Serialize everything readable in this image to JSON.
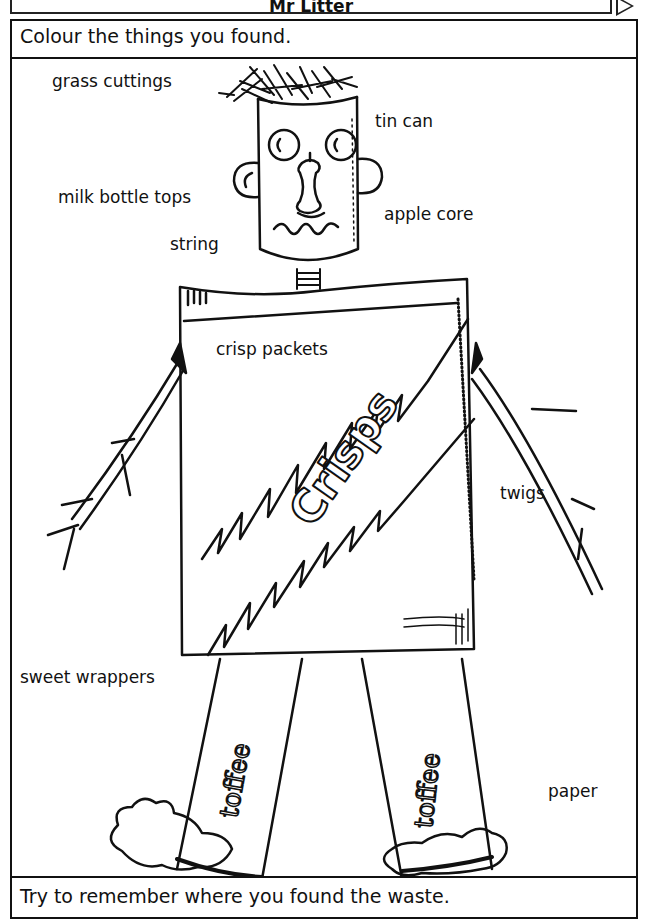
{
  "header": {
    "title": "Mr Litter"
  },
  "instruction": "Colour the things you found.",
  "footer": "Try to remember where you found the waste.",
  "figure": {
    "labels": [
      {
        "id": "grass-cuttings",
        "text": "grass cuttings"
      },
      {
        "id": "tin-can",
        "text": "tin can"
      },
      {
        "id": "milk-bottle-tops",
        "text": "milk bottle tops"
      },
      {
        "id": "apple-core",
        "text": "apple core"
      },
      {
        "id": "string",
        "text": "string"
      },
      {
        "id": "crisp-packets",
        "text": "crisp packets"
      },
      {
        "id": "twigs",
        "text": "twigs"
      },
      {
        "id": "sweet-wrappers",
        "text": "sweet wrappers"
      },
      {
        "id": "paper",
        "text": "paper"
      }
    ],
    "packet_text": "Crisps",
    "wrapper_text": "toffee"
  }
}
